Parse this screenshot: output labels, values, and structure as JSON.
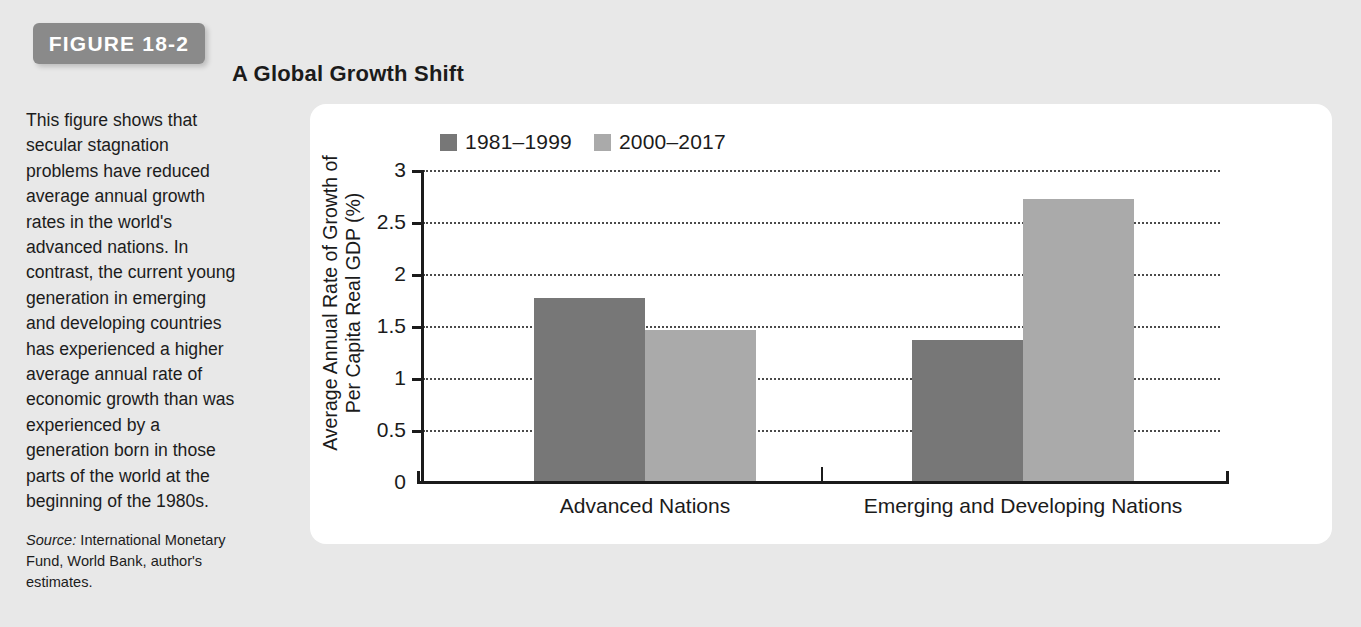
{
  "figure": {
    "badge_label": "FIGURE 18-2",
    "title": "A Global Growth Shift",
    "caption": "This figure shows that secular stagnation problems have reduced average annual growth rates in the world's advanced nations. In contrast, the current young generation in emerging and developing countries has experienced a higher average annual rate of economic growth than was experienced by a generation born in those parts of the world at the beginning of the 1980s.",
    "source_label": "Source:",
    "source_text": "International Monetary Fund, World Bank, author's estimates."
  },
  "colors": {
    "page_background": "#e8e8e8",
    "panel_background": "#ffffff",
    "badge_background": "#8a8a8a",
    "series_1": "#777777",
    "series_2": "#aaaaaa",
    "axis": "#1b1b1b",
    "gridline": "#4a4a4a"
  },
  "chart_data": {
    "type": "bar",
    "title": "A Global Growth Shift",
    "xlabel": "",
    "ylabel": "Average Annual Rate of Growth of Per Capita Real GDP (%)",
    "ylabel_line1": "Average Annual Rate of Growth of",
    "ylabel_line2": "Per Capita Real GDP (%)",
    "categories": [
      "Advanced Nations",
      "Emerging and Developing Nations"
    ],
    "series": [
      {
        "name": "1981–1999",
        "color": "#777777",
        "values": [
          1.77,
          1.37
        ]
      },
      {
        "name": "2000–2017",
        "color": "#aaaaaa",
        "values": [
          1.46,
          2.72
        ]
      }
    ],
    "ylim": [
      0,
      3
    ],
    "yticks": [
      0,
      0.5,
      1,
      1.5,
      2,
      2.5,
      3
    ],
    "ytick_labels": [
      "0",
      "0.5",
      "1",
      "1.5",
      "2",
      "2.5",
      "3"
    ],
    "grid": true,
    "grid_style": "dotted",
    "legend_position": "top-left"
  }
}
